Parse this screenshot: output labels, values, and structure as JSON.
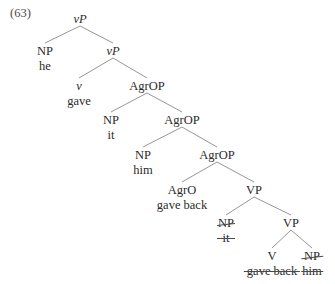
{
  "figure": {
    "example_number": "(63)",
    "background_color": "#ffffff",
    "text_color": "#2b2b2b",
    "branch_color": "#8a8a8a",
    "tree": {
      "nodes": [
        {
          "id": "vp-root",
          "category": "vP",
          "italic_first_letter": true,
          "word": "",
          "category_struck": false,
          "word_struck": false,
          "x": 80,
          "y": 12
        },
        {
          "id": "np-he",
          "category": "NP",
          "italic_first_letter": false,
          "word": "he",
          "category_struck": false,
          "word_struck": false,
          "x": 45,
          "y": 44
        },
        {
          "id": "vp-inner",
          "category": "vP",
          "italic_first_letter": true,
          "word": "",
          "category_struck": false,
          "word_struck": false,
          "x": 113,
          "y": 44
        },
        {
          "id": "v-gave",
          "category": "v",
          "italic_first_letter": true,
          "word": "gave",
          "category_struck": false,
          "word_struck": false,
          "x": 79,
          "y": 79
        },
        {
          "id": "agrop-1",
          "category": "AgrOP",
          "italic_first_letter": false,
          "word": "",
          "category_struck": false,
          "word_struck": false,
          "x": 147,
          "y": 79
        },
        {
          "id": "np-it",
          "category": "NP",
          "italic_first_letter": false,
          "word": "it",
          "category_struck": false,
          "word_struck": false,
          "x": 111,
          "y": 113
        },
        {
          "id": "agrop-2",
          "category": "AgrOP",
          "italic_first_letter": false,
          "word": "",
          "category_struck": false,
          "word_struck": false,
          "x": 182,
          "y": 113
        },
        {
          "id": "np-him",
          "category": "NP",
          "italic_first_letter": false,
          "word": "him",
          "category_struck": false,
          "word_struck": false,
          "x": 143,
          "y": 148
        },
        {
          "id": "agrop-3",
          "category": "AgrOP",
          "italic_first_letter": false,
          "word": "",
          "category_struck": false,
          "word_struck": false,
          "x": 217,
          "y": 148
        },
        {
          "id": "agro-gaveback",
          "category": "AgrO",
          "italic_first_letter": false,
          "word": "gave back",
          "category_struck": false,
          "word_struck": false,
          "x": 182,
          "y": 183
        },
        {
          "id": "vp-1",
          "category": "VP",
          "italic_first_letter": false,
          "word": "",
          "category_struck": false,
          "word_struck": false,
          "x": 254,
          "y": 183
        },
        {
          "id": "np-it-trace",
          "category": "NP",
          "italic_first_letter": false,
          "word": "it",
          "category_struck": true,
          "word_struck": true,
          "x": 226,
          "y": 216
        },
        {
          "id": "vp-2",
          "category": "VP",
          "italic_first_letter": false,
          "word": "",
          "category_struck": false,
          "word_struck": false,
          "x": 291,
          "y": 216
        },
        {
          "id": "v-trace",
          "category": "V",
          "italic_first_letter": false,
          "word": "gave back",
          "category_struck": false,
          "word_struck": true,
          "x": 272,
          "y": 249
        },
        {
          "id": "np-him-trace",
          "category": "NP",
          "italic_first_letter": false,
          "word": "him",
          "category_struck": true,
          "word_struck": true,
          "x": 312,
          "y": 249
        }
      ],
      "edges": [
        {
          "from": "vp-root",
          "to": "np-he"
        },
        {
          "from": "vp-root",
          "to": "vp-inner"
        },
        {
          "from": "vp-inner",
          "to": "v-gave"
        },
        {
          "from": "vp-inner",
          "to": "agrop-1"
        },
        {
          "from": "agrop-1",
          "to": "np-it"
        },
        {
          "from": "agrop-1",
          "to": "agrop-2"
        },
        {
          "from": "agrop-2",
          "to": "np-him"
        },
        {
          "from": "agrop-2",
          "to": "agrop-3"
        },
        {
          "from": "agrop-3",
          "to": "agro-gaveback"
        },
        {
          "from": "agrop-3",
          "to": "vp-1"
        },
        {
          "from": "vp-1",
          "to": "np-it-trace"
        },
        {
          "from": "vp-1",
          "to": "vp-2"
        },
        {
          "from": "vp-2",
          "to": "v-trace"
        },
        {
          "from": "vp-2",
          "to": "np-him-trace"
        }
      ]
    }
  }
}
